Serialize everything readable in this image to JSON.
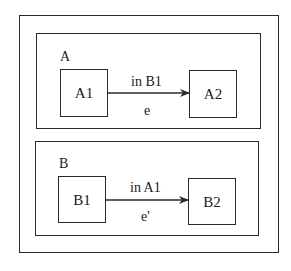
{
  "diagram": {
    "outer": {
      "x": 19,
      "y": 15,
      "w": 260,
      "h": 238
    },
    "regions": [
      {
        "name": "A",
        "label": "A",
        "box": {
          "x": 36,
          "y": 33,
          "w": 225,
          "h": 96
        },
        "states": [
          {
            "name": "A1",
            "label": "A1",
            "box": {
              "x": 60,
              "y": 69,
              "w": 48,
              "h": 48
            }
          },
          {
            "name": "A2",
            "label": "A2",
            "box": {
              "x": 189,
              "y": 70,
              "w": 48,
              "h": 48
            }
          }
        ],
        "transition": {
          "from": "A1",
          "to": "A2",
          "guard": "in B1",
          "event": "e"
        }
      },
      {
        "name": "B",
        "label": "B",
        "box": {
          "x": 35,
          "y": 141,
          "w": 224,
          "h": 95
        },
        "states": [
          {
            "name": "B1",
            "label": "B1",
            "box": {
              "x": 58,
              "y": 176,
              "w": 48,
              "h": 47
            }
          },
          {
            "name": "B2",
            "label": "B2",
            "box": {
              "x": 188,
              "y": 178,
              "w": 48,
              "h": 47
            }
          }
        ],
        "transition": {
          "from": "B1",
          "to": "B2",
          "guard": "in A1",
          "event": "e'"
        }
      }
    ]
  }
}
